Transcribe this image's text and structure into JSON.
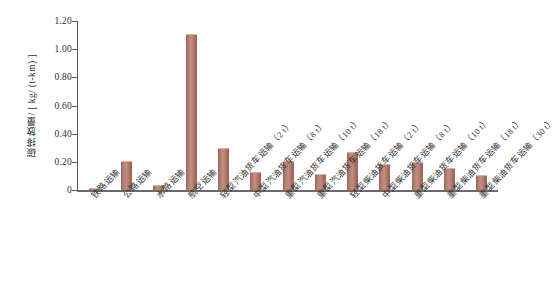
{
  "chart_data": {
    "type": "bar",
    "title": "",
    "xlabel": "",
    "ylabel": "碳排放量/ [ kg/ (t-km) ]",
    "ylim": [
      0,
      1.2
    ],
    "ytick_labels": [
      "1.20",
      "1.00",
      "0.80",
      "0.60",
      "0.40",
      "0.20",
      "0"
    ],
    "ytick_values": [
      1.2,
      1.0,
      0.8,
      0.6,
      0.4,
      0.2,
      0
    ],
    "grid": false,
    "legend": "none",
    "bar_color": "#b07a6e",
    "axis_color": "#5a5a5a",
    "categories": [
      "铁路运输",
      "公路运输",
      "水路运输",
      "航空运输",
      "轻型汽油货车运输（2 t）",
      "中型汽油货车运输（8 t）",
      "重型汽油货车运输（10 t）",
      "重型汽油货车运输（18 t）",
      "轻型柴油货车运输（2 t）",
      "中型柴油货车运输（8 t）",
      "重型柴油货车运输（10 t）",
      "重型柴油货车运输（18 t）",
      "重型柴油货车运输（30 t）"
    ],
    "values": [
      0.01,
      0.2,
      0.03,
      1.1,
      0.29,
      0.12,
      0.2,
      0.11,
      0.26,
      0.18,
      0.19,
      0.15,
      0.1
    ]
  }
}
